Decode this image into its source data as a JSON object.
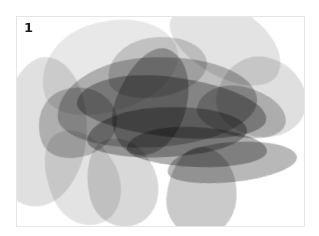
{
  "panel": {
    "label": "1",
    "description": "Abstract grayscale artwork of overlapping translucent brush strokes",
    "border_color": "#e6e6e6",
    "background": "#ffffff"
  },
  "strokes": [
    {
      "x": 22,
      "y": 4,
      "w": 140,
      "h": 90,
      "rot": -18,
      "color": "#e4e4e4",
      "opacity": 0.85
    },
    {
      "x": -20,
      "y": 40,
      "w": 90,
      "h": 150,
      "rot": 8,
      "color": "#d9d9d9",
      "opacity": 0.8
    },
    {
      "x": 150,
      "y": -10,
      "w": 120,
      "h": 70,
      "rot": 30,
      "color": "#dcdcdc",
      "opacity": 0.8
    },
    {
      "x": 200,
      "y": 40,
      "w": 90,
      "h": 80,
      "rot": 10,
      "color": "#d4d4d4",
      "opacity": 0.75
    },
    {
      "x": 30,
      "y": 110,
      "w": 70,
      "h": 100,
      "rot": -25,
      "color": "#e0e0e0",
      "opacity": 0.9
    },
    {
      "x": 70,
      "y": 120,
      "w": 70,
      "h": 90,
      "rot": -15,
      "color": "#cfcfcf",
      "opacity": 0.8
    },
    {
      "x": 150,
      "y": 130,
      "w": 70,
      "h": 90,
      "rot": 5,
      "color": "#bdbdbd",
      "opacity": 0.8
    },
    {
      "x": 40,
      "y": 40,
      "w": 200,
      "h": 90,
      "rot": -4,
      "color": "#a9a9a9",
      "opacity": 0.75
    },
    {
      "x": 60,
      "y": 60,
      "w": 190,
      "h": 60,
      "rot": 6,
      "color": "#8f8f8f",
      "opacity": 0.7
    },
    {
      "x": 100,
      "y": 30,
      "w": 70,
      "h": 110,
      "rot": 20,
      "color": "#888888",
      "opacity": 0.6
    },
    {
      "x": 70,
      "y": 90,
      "w": 160,
      "h": 50,
      "rot": -3,
      "color": "#7a7a7a",
      "opacity": 0.6
    },
    {
      "x": 110,
      "y": 110,
      "w": 140,
      "h": 40,
      "rot": 2,
      "color": "#6e6e6e",
      "opacity": 0.55
    },
    {
      "x": 150,
      "y": 125,
      "w": 130,
      "h": 40,
      "rot": -6,
      "color": "#9a9a9a",
      "opacity": 0.7
    },
    {
      "x": 180,
      "y": 70,
      "w": 90,
      "h": 50,
      "rot": 12,
      "color": "#a0a0a0",
      "opacity": 0.6
    },
    {
      "x": 90,
      "y": 20,
      "w": 100,
      "h": 60,
      "rot": -10,
      "color": "#b7b7b7",
      "opacity": 0.6
    },
    {
      "x": 20,
      "y": 70,
      "w": 80,
      "h": 70,
      "rot": -20,
      "color": "#999999",
      "opacity": 0.55
    }
  ]
}
